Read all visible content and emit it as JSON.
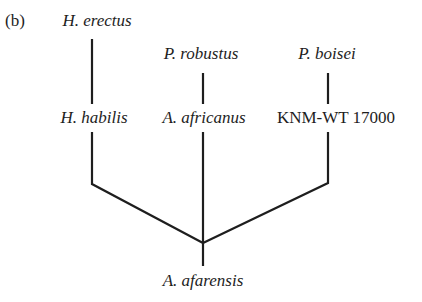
{
  "panel_label": "(b)",
  "taxa": {
    "h_erectus": "H. erectus",
    "p_robustus": "P. robustus",
    "p_boisei": "P. boisei",
    "h_habilis": "H. habilis",
    "a_africanus": "A. africanus",
    "knm_wt_17000": "KNM-WT 17000",
    "a_afarensis": "A. afarensis"
  },
  "colors": {
    "line": "#1e1e1e",
    "text": "#1e1e1e",
    "background": "#ffffff"
  }
}
